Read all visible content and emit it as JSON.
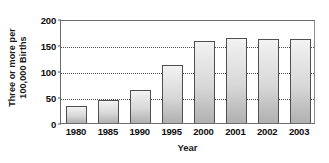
{
  "chart_data": {
    "type": "bar",
    "title": "",
    "xlabel": "Year",
    "ylabel": "Three or more per 100,000 Births",
    "ylabel_lines": [
      "Three or more per",
      "100,000 Births"
    ],
    "categories": [
      "1980",
      "1985",
      "1990",
      "1995",
      "2000",
      "2001",
      "2002",
      "2003"
    ],
    "values": [
      33,
      45,
      63,
      112,
      158,
      163,
      161,
      162
    ],
    "ylim": [
      0,
      200
    ],
    "yticks": [
      0,
      50,
      100,
      150,
      200
    ],
    "ytick_labels": [
      "0",
      "50",
      "100",
      "150",
      "200"
    ],
    "grid": true,
    "grid_axis": "y",
    "legend": "none",
    "colors": {
      "bar_fill_light": "#f3f3f3",
      "bar_fill_dark": "#b0b0b0",
      "bar_border": "#4f4f4f",
      "axis": "#6b6b6b",
      "gridline": "#4d4d4d",
      "text": "#0d0d0d",
      "background": "#ffffff"
    }
  }
}
